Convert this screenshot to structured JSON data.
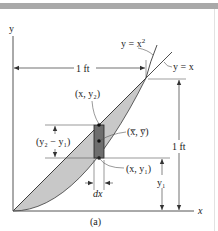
{
  "figure": {
    "caption": "(a)",
    "axes": {
      "x_label": "x",
      "y_label": "y"
    },
    "curves": [
      {
        "name": "parabola",
        "equation_prefix": "y = x",
        "equation_exponent": "2"
      },
      {
        "name": "line",
        "equation": "y = x"
      }
    ],
    "dimensions": {
      "horizontal": "1 ft",
      "vertical": "1 ft",
      "element_height": "(y₂ − y₁)",
      "element_width": "dx",
      "y1": "y₁"
    },
    "points": {
      "top": "(x, y₂)",
      "centroid": "(x̅, y̅)",
      "bottom": "(x, y₁)"
    },
    "colors": {
      "region_fill": "#c8c8c8",
      "element_fill": "#6e6e6e",
      "line": "#3a3a3a",
      "top_bar": "#a9a9a9"
    }
  }
}
